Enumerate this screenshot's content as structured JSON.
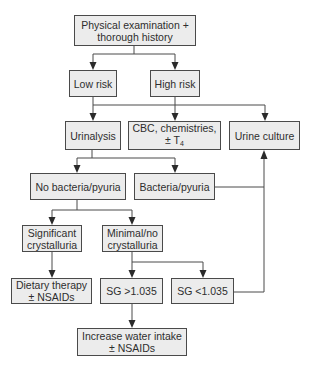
{
  "diagram": {
    "type": "flowchart",
    "nodes": {
      "start": {
        "line1": "Physical examination +",
        "line2": "thorough history"
      },
      "low_risk": {
        "label": "Low risk"
      },
      "high_risk": {
        "label": "High risk"
      },
      "urinalysis": {
        "label": "Urinalysis"
      },
      "cbc": {
        "line1": "CBC, chemistries,",
        "line2_prefix": "± T",
        "line2_sub": "4"
      },
      "urine_culture": {
        "label": "Urine culture"
      },
      "no_bacteria": {
        "label": "No bacteria/pyuria"
      },
      "bacteria": {
        "label": "Bacteria/pyuria"
      },
      "significant": {
        "line1": "Significant",
        "line2": "crystalluria"
      },
      "minimal": {
        "line1": "Minimal/no",
        "line2": "crystalluria"
      },
      "dietary": {
        "line1": "Dietary therapy",
        "line2": "± NSAIDs"
      },
      "sg_high": {
        "label": "SG >1.035"
      },
      "sg_low": {
        "label": "SG <1.035"
      },
      "water": {
        "line1": "Increase water intake",
        "line2": "± NSAIDs"
      }
    },
    "edges": [
      [
        "start",
        "low_risk"
      ],
      [
        "start",
        "high_risk"
      ],
      [
        "low_risk",
        "urinalysis"
      ],
      [
        "high_risk",
        "cbc"
      ],
      [
        "high_risk",
        "urine_culture"
      ],
      [
        "urinalysis",
        "no_bacteria"
      ],
      [
        "urinalysis",
        "bacteria"
      ],
      [
        "bacteria",
        "urine_culture"
      ],
      [
        "no_bacteria",
        "significant"
      ],
      [
        "no_bacteria",
        "minimal"
      ],
      [
        "significant",
        "dietary"
      ],
      [
        "minimal",
        "sg_high"
      ],
      [
        "minimal",
        "sg_low"
      ],
      [
        "sg_low",
        "urine_culture"
      ],
      [
        "sg_high",
        "water"
      ]
    ],
    "colors": {
      "box_fill": "#ececec",
      "stroke": "#4a4a4a",
      "text": "#2e2e2e"
    }
  }
}
